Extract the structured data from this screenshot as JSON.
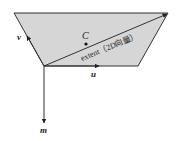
{
  "diagram": {
    "type": "geometry-vector-diagram",
    "colors": {
      "fill": "#d6d6d6",
      "stroke": "#333333",
      "background": "#ffffff"
    },
    "shape": {
      "name": "trapezoid-plane",
      "points": [
        [
          14,
          13
        ],
        [
          168,
          13
        ],
        [
          138,
          66
        ],
        [
          44,
          66
        ]
      ]
    },
    "origin": [
      44,
      66
    ],
    "vectors": {
      "u": {
        "label": "u",
        "from": [
          44,
          66
        ],
        "to": [
          100,
          66
        ]
      },
      "v": {
        "label": "v",
        "from": [
          44,
          66
        ],
        "to": [
          27,
          36
        ]
      },
      "m": {
        "label": "m",
        "from": [
          44,
          66
        ],
        "to": [
          44,
          124
        ]
      },
      "extent": {
        "label": "extent（2D向量）",
        "from": [
          44,
          66
        ],
        "to": [
          168,
          14
        ]
      }
    },
    "point": {
      "label": "C",
      "pos": [
        86,
        44
      ]
    }
  }
}
